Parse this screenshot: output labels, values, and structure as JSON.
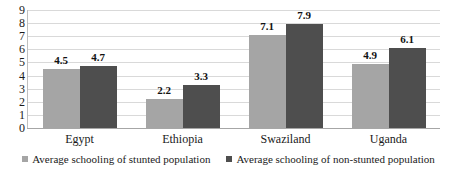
{
  "chart_data": {
    "type": "bar",
    "title": "",
    "subtitle": "",
    "xlabel": "",
    "ylabel": "",
    "ylim": [
      0,
      9
    ],
    "yticks": [
      9,
      8,
      7,
      6,
      5,
      4,
      3,
      2,
      1,
      0
    ],
    "grid": true,
    "legend_position": "bottom",
    "categories": [
      "Egypt",
      "Ethiopia",
      "Swaziland",
      "Uganda"
    ],
    "series": [
      {
        "name": "Average schooling of stunted population",
        "color": "#a5a5a5",
        "values": [
          4.5,
          2.2,
          7.1,
          4.9
        ],
        "value_labels": [
          "4.5",
          "2.2",
          "7.1",
          "4.9"
        ]
      },
      {
        "name": "Average schooling of non-stunted population",
        "color": "#4e4e4e",
        "values": [
          4.7,
          3.3,
          7.9,
          6.1
        ],
        "value_labels": [
          "4.7",
          "3.3",
          "7.9",
          "6.1"
        ]
      }
    ]
  },
  "legend": {
    "items": [
      {
        "label": "Average schooling of stunted population",
        "swatch": "legend-swatch-icon"
      },
      {
        "label": "Average schooling of non-stunted population",
        "swatch": "legend-swatch-icon"
      }
    ]
  },
  "colors": {
    "series_a": "#a5a5a5",
    "series_b": "#4e4e4e",
    "gridline": "#d9d9d9",
    "axis": "#a6a6a6",
    "text": "#1a1a1a",
    "background": "#ffffff"
  }
}
